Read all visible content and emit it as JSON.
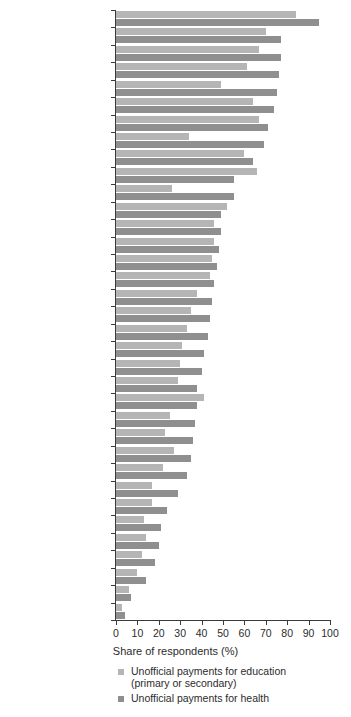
{
  "chart_data": {
    "type": "bar",
    "orientation": "horizontal",
    "title": "",
    "xlabel": "Share of respondents (%)",
    "ylabel": "",
    "xlim": [
      0,
      100
    ],
    "xticks": [
      0,
      10,
      20,
      30,
      40,
      50,
      60,
      70,
      80,
      90,
      100
    ],
    "grid": false,
    "legend_position": "below-axis-left",
    "categories": [
      "Azerbaijan",
      "Kyrgyz Republic",
      "Moldova",
      "Ukraine",
      "Romania",
      "Tajikistan",
      "Albania",
      "Hungary",
      "Slovak Republic",
      "Armenia",
      "Lithuania",
      "Belarus",
      "Bosnia and Herzegovina",
      "Russian Federation",
      "Uzbekistan",
      "Serbia",
      "Croatia",
      "Bulgaria",
      "Montenegro",
      "Kazakhstan",
      "Czech Republic",
      "Mongolia",
      "Turkey",
      "Latvia",
      "Kosovo",
      "Macedonia, FYR",
      "Poland",
      "Slovenia",
      "Georgia",
      "Italy",
      "France",
      "Estonia",
      "Germany",
      "United Kingdom",
      "Sweden"
    ],
    "series": [
      {
        "name": "Unofficial payments for education (primary or secondary)",
        "color": "#b5b5b5",
        "values": [
          84,
          70,
          67,
          61,
          49,
          64,
          67,
          34,
          60,
          66,
          26,
          52,
          46,
          46,
          45,
          44,
          38,
          35,
          33,
          31,
          30,
          29,
          41,
          25,
          23,
          27,
          22,
          17,
          17,
          13,
          14,
          12,
          10,
          6,
          3
        ]
      },
      {
        "name": "Unofficial payments for health",
        "color": "#8f8f8f",
        "values": [
          95,
          77,
          77,
          76,
          75,
          74,
          71,
          69,
          64,
          55,
          55,
          49,
          49,
          48,
          47,
          46,
          45,
          44,
          43,
          41,
          40,
          38,
          38,
          37,
          36,
          35,
          33,
          29,
          24,
          21,
          20,
          18,
          14,
          7,
          4
        ]
      }
    ],
    "legend": [
      {
        "label": "Unofficial payments for education",
        "sublabel": "(primary or secondary)",
        "color": "#b5b5b5"
      },
      {
        "label": "Unofficial payments for health",
        "sublabel": "",
        "color": "#8f8f8f"
      }
    ],
    "colors": {
      "education": "#b5b5b5",
      "health": "#8f8f8f",
      "axis": "#3a3a3a",
      "text": "#2b2b2b",
      "background": "#ffffff"
    }
  }
}
